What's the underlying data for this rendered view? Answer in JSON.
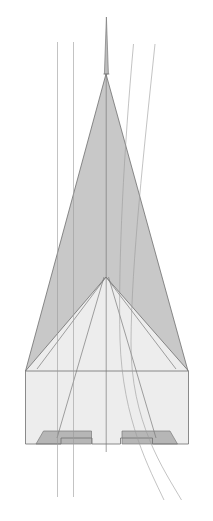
{
  "figure": {
    "type": "technical-line-drawing",
    "canvas": {
      "width": 213,
      "height": 521,
      "background": "#ffffff"
    },
    "colors": {
      "background": "#ffffff",
      "upper_delta_fill": "#c8c8c8",
      "lower_body_fill": "#ededed",
      "nozzle_fill": "#b6b6b6",
      "outline_stroke": "#6e6e6e",
      "interior_stroke": "#7a7a7a",
      "reference_line_stroke": "#9a9a9a",
      "spire_fill": "#bdbdbd"
    },
    "stroke_widths": {
      "outline": 0.8,
      "interior": 0.7,
      "reference_line": 0.6
    }
  },
  "parts": [
    {
      "name": "nose-spire",
      "label": "Nose spire",
      "fill": "#bdbdbd",
      "points": "106.4,17 108.4,74 104.4,74"
    },
    {
      "name": "upper-delta-left",
      "label": "Upper delta left panel",
      "fill": "#c8c8c8",
      "points": "106.0,74 106.0,277 26.5,371 46.5,370"
    },
    {
      "name": "upper-delta-body",
      "label": "Upper delta wing planform",
      "fill": "#c8c8c8",
      "points": "106.0,74 188.0,371 25.5,371"
    },
    {
      "name": "lower-fuselage",
      "label": "Lower fuselage and wing underside",
      "fill": "#ededed",
      "points": "106.0,277 188.5,371 188.5,444 152.5,444 152.5,438 120.5,438 120.5,444 92.0,444 92.0,438 61.0,438 61.0,444 25.5,444 25.5,371"
    },
    {
      "name": "nozzle-left",
      "label": "Left aft nozzle bay",
      "fill": "#b6b6b6",
      "points": "43.5,431 91.5,431 91.5,444 36.0,444"
    },
    {
      "name": "nozzle-right",
      "label": "Right aft nozzle bay",
      "fill": "#b6b6b6",
      "points": "122.0,431 170.0,431 177.5,444 122.0,444"
    }
  ],
  "outlines": [
    {
      "name": "upper-delta-outline",
      "label": "Upper delta outline",
      "points": "106.0,74 188.0,371 25.5,371 106.0,74"
    },
    {
      "name": "lower-body-outline",
      "label": "Lower body outline",
      "points": "25.5,371 25.5,444 61.0,444 61.0,438 92.0,438 92.0,444 120.5,444 120.5,438 152.5,438 152.5,444 188.5,444 188.5,371"
    },
    {
      "name": "chine-vee",
      "label": "Central chine vee crease",
      "points": "25.5,371 106.0,277 188.5,371"
    }
  ],
  "interior_lines": [
    {
      "name": "center-axis-line",
      "label": "Centre axis",
      "points": "106.2,74 106.2,452"
    },
    {
      "name": "spire-base-line",
      "label": "Spire base tick",
      "points": "103.4,74 109.4,74"
    },
    {
      "name": "left-fuselage-crease",
      "label": "Left fuselage crease",
      "points": "104.0,277 57.0,438"
    },
    {
      "name": "right-fuselage-crease",
      "label": "Right fuselage crease",
      "points": "108.5,277 156.0,438"
    },
    {
      "name": "left-inner-chine",
      "label": "Left inner chine",
      "points": "106.0,277 37.0,369"
    },
    {
      "name": "right-inner-chine",
      "label": "Right inner chine",
      "points": "106.0,277 176.0,369"
    }
  ],
  "reference_lines": [
    {
      "name": "reference-line-left-outer",
      "label": "Left outer reference line",
      "kind": "straight",
      "points": "57.5,42 57.5,497"
    },
    {
      "name": "reference-line-left-inner",
      "label": "Left inner reference line",
      "kind": "straight",
      "points": "73.5,42 73.5,497"
    },
    {
      "name": "reference-line-right-inner",
      "label": "Right inner curved reference line",
      "kind": "curved",
      "path": "M 133.5,44 C 124.0,150 118.0,260 120.0,340 C 122.5,420 150.0,470 164.0,500"
    },
    {
      "name": "reference-line-right-outer",
      "label": "Right outer curved reference line",
      "kind": "curved",
      "path": "M 155.0,44 C 144.0,150 131.5,262 131.0,342 C 130.5,422 164.0,470 181.5,500"
    }
  ]
}
